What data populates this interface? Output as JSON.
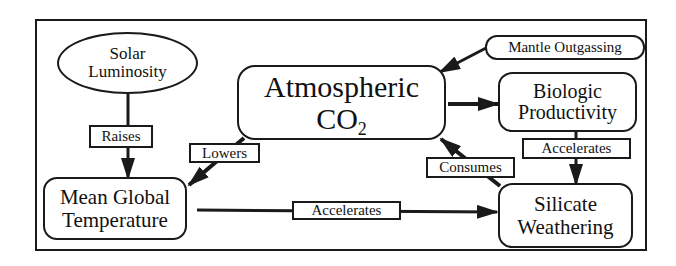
{
  "diagram": {
    "title": "",
    "nodes": {
      "solar": {
        "line1": "Solar",
        "line2": "Luminosity",
        "shape": "ellipse"
      },
      "co2": {
        "line1": "Atmospheric",
        "line2_main": "CO",
        "line2_sub": "2",
        "shape": "rounded-rect"
      },
      "mantle": {
        "label": "Mantle Outgassing",
        "shape": "rounded-rect"
      },
      "biologic": {
        "line1": "Biologic",
        "line2": "Productivity",
        "shape": "rounded-rect"
      },
      "temperature": {
        "line1": "Mean Global",
        "line2": "Temperature",
        "shape": "rounded-rect"
      },
      "silicate": {
        "line1": "Silicate",
        "line2": "Weathering",
        "shape": "rounded-rect"
      }
    },
    "edges": [
      {
        "from": "Solar Luminosity",
        "to": "Mean Global Temperature",
        "label": "Raises"
      },
      {
        "from": "Atmospheric CO2",
        "to": "Mean Global Temperature",
        "label": "Lowers"
      },
      {
        "from": "Mantle Outgassing",
        "to": "Atmospheric CO2",
        "label": ""
      },
      {
        "from": "Atmospheric CO2",
        "to": "Biologic Productivity",
        "label": ""
      },
      {
        "from": "Biologic Productivity",
        "to": "Silicate Weathering",
        "label": "Accelerates"
      },
      {
        "from": "Silicate Weathering",
        "to": "Atmospheric CO2",
        "label": "Consumes"
      },
      {
        "from": "Mean Global Temperature",
        "to": "Silicate Weathering",
        "label": "Accelerates"
      }
    ],
    "edge_labels": {
      "raises": "Raises",
      "lowers": "Lowers",
      "accelerates_bio": "Accelerates",
      "consumes": "Consumes",
      "accelerates_temp": "Accelerates"
    },
    "colors": {
      "stroke": "#1a1a1a",
      "background": "#ffffff"
    }
  }
}
